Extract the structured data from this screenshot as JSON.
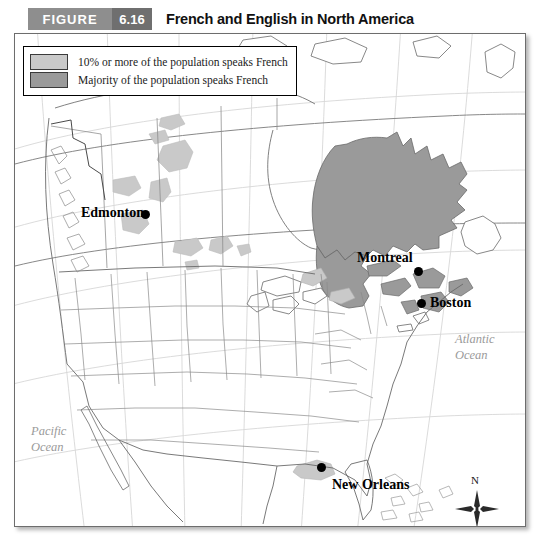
{
  "header": {
    "figure_word": "FIGURE",
    "figure_number": "6.16",
    "title": "French and English in North America",
    "figure_word_bg": "#8e8e8e",
    "figure_number_bg": "#6f6f6f"
  },
  "legend": {
    "items": [
      {
        "label": "10% or more of the population speaks French",
        "color": "#c9c9c9"
      },
      {
        "label": "Majority of the population speaks French",
        "color": "#9a9a9a"
      }
    ]
  },
  "map": {
    "cities": [
      {
        "name": "Edmonton",
        "label": "Edmonton"
      },
      {
        "name": "Montreal",
        "label": "Montreal"
      },
      {
        "name": "Boston",
        "label": "Boston"
      },
      {
        "name": "New Orleans",
        "label": "New Orleans"
      }
    ],
    "oceans": [
      {
        "name": "pacific",
        "line1": "Pacific",
        "line2": "Ocean"
      },
      {
        "name": "atlantic",
        "line1": "Atlantic",
        "line2": "Ocean"
      }
    ],
    "scale": {
      "zero": "0",
      "max": "1000 km"
    },
    "compass": {
      "north": "N"
    },
    "colors": {
      "minority_fill": "#c9c9c9",
      "majority_fill": "#9a9a9a",
      "coastline": "#6a6a6a",
      "border": "#8a8a8a",
      "graticule": "#d2d2d2"
    }
  }
}
